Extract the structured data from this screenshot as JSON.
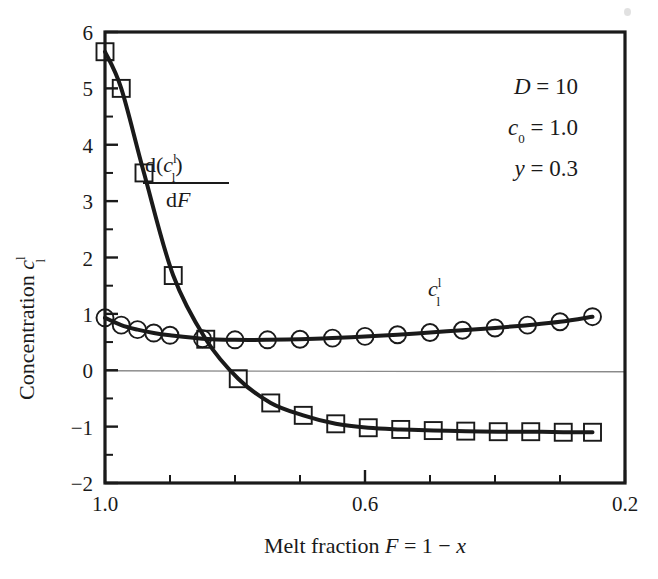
{
  "figure": {
    "background_color": "#ffffff",
    "ink_color": "#1a1a1a",
    "gridline_color": "#8a8a8a"
  },
  "axes": {
    "x": {
      "title_parts": {
        "prefix": "Melt fraction ",
        "symbol": "F",
        "equals": " = 1 − ",
        "variable": "x"
      },
      "title_plain": "Melt fraction F = 1 − x",
      "major_ticks": [
        "1.0",
        "0.6",
        "0.2"
      ],
      "major_tick_values": [
        1.0,
        0.6,
        0.2
      ],
      "minor_tick_values": [
        0.9,
        0.8,
        0.7,
        0.5,
        0.4,
        0.3
      ],
      "range": [
        1.0,
        0.2
      ],
      "direction": "reversed"
    },
    "y": {
      "title_parts": {
        "prefix": "Concentration ",
        "symbol": "c",
        "subscript": "l",
        "superscript": "l"
      },
      "title_plain": "Concentration c_l^l",
      "major_ticks": [
        "6",
        "5",
        "4",
        "3",
        "2",
        "1",
        "0",
        "−1",
        "−2"
      ],
      "major_tick_values": [
        6,
        5,
        4,
        3,
        2,
        1,
        0,
        -1,
        -2
      ],
      "minor_tick_values": [
        5.5,
        4.5,
        3.5,
        2.5,
        1.5,
        0.5,
        -0.5,
        -1.5
      ],
      "range": [
        -2,
        6
      ]
    }
  },
  "annotations": {
    "parameters": [
      {
        "symbol": "D",
        "sub": "",
        "equals": " = ",
        "value": "10"
      },
      {
        "symbol": "c",
        "sub": "0",
        "equals": " = ",
        "value": "1.0"
      },
      {
        "symbol": "y",
        "sub": "",
        "equals": " = ",
        "value": "0.3"
      }
    ],
    "parameters_plain": [
      "D = 10",
      "c0 = 1.0",
      "y = 0.3"
    ],
    "derivative_label": {
      "numerator": "d(c_l^l)",
      "denominator": "dF",
      "plain": "d(c_l^l)/dF"
    },
    "concentration_label": {
      "symbol": "c",
      "subscript": "l",
      "superscript": "l",
      "plain": "c_l^l"
    }
  },
  "chart_data": {
    "type": "line",
    "title": "",
    "xlabel": "Melt fraction F = 1 − x",
    "ylabel": "Concentration c_l^l",
    "xlim": [
      1.0,
      0.2
    ],
    "ylim": [
      -2,
      6
    ],
    "x_reversed": true,
    "grid": false,
    "zero_line": true,
    "legend": "inline-labels",
    "series": [
      {
        "name": "c_l^l",
        "label_plain": "c_l^l",
        "marker": "circle",
        "x": [
          1.0,
          0.975,
          0.95,
          0.925,
          0.9,
          0.85,
          0.8,
          0.75,
          0.7,
          0.65,
          0.6,
          0.55,
          0.5,
          0.45,
          0.4,
          0.35,
          0.3,
          0.25
        ],
        "values": [
          0.93,
          0.8,
          0.72,
          0.66,
          0.62,
          0.56,
          0.54,
          0.54,
          0.55,
          0.57,
          0.6,
          0.63,
          0.67,
          0.71,
          0.75,
          0.8,
          0.86,
          0.95
        ]
      },
      {
        "name": "d(c_l^l)/dF",
        "label_plain": "d(c_l^l)/dF",
        "marker": "square",
        "x": [
          1.0,
          0.975,
          0.94,
          0.895,
          0.845,
          0.795,
          0.745,
          0.695,
          0.645,
          0.595,
          0.545,
          0.495,
          0.445,
          0.395,
          0.345,
          0.295,
          0.25
        ],
        "values": [
          5.65,
          5.0,
          3.5,
          1.68,
          0.55,
          -0.15,
          -0.58,
          -0.8,
          -0.95,
          -1.02,
          -1.05,
          -1.07,
          -1.08,
          -1.09,
          -1.09,
          -1.1,
          -1.1
        ]
      }
    ]
  }
}
